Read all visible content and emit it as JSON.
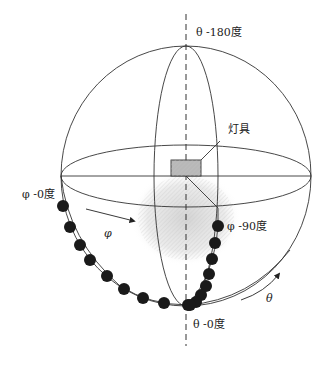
{
  "diagram": {
    "labels": {
      "theta_top": "θ -180度",
      "theta_bottom": "θ -0度",
      "phi_start": "φ -0度",
      "phi_end": "φ -90度",
      "luminaire": "灯具",
      "phi_arrow": "φ",
      "theta_arrow": "θ"
    },
    "colors": {
      "line": "#333333",
      "dot": "#1a1a1a",
      "box_fill": "#b8b8b8",
      "glow": "#cfcfcf"
    },
    "phi0_points": [
      [
        63,
        206
      ],
      [
        70,
        227
      ],
      [
        80,
        245
      ],
      [
        90,
        260
      ],
      [
        107,
        276
      ],
      [
        124,
        289
      ],
      [
        143,
        298
      ],
      [
        164,
        303
      ],
      [
        188,
        305
      ]
    ],
    "phi90_points": [
      [
        218,
        226
      ],
      [
        215,
        243
      ],
      [
        212,
        259
      ],
      [
        209,
        274
      ],
      [
        206,
        286
      ],
      [
        201,
        295
      ],
      [
        196,
        302
      ],
      [
        190,
        305
      ]
    ]
  }
}
